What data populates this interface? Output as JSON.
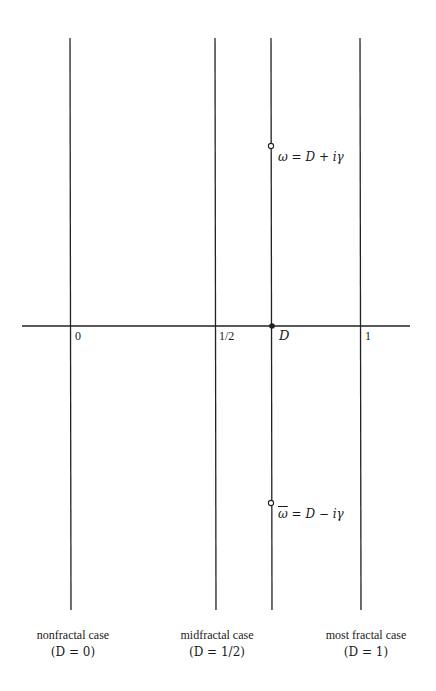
{
  "diagram": {
    "type": "complex-plane-fractal-dimension",
    "axis": {
      "ticks": [
        {
          "label": "0",
          "x": 71
        },
        {
          "label": "1/2",
          "x": 216
        },
        {
          "label": "D",
          "x": 272
        },
        {
          "label": "1",
          "x": 361
        }
      ]
    },
    "points": {
      "omega": {
        "label": "ω = D + iγ"
      },
      "omega_bar": {
        "label_bar": "ω",
        "label_rest": " = D − iγ"
      },
      "D": {
        "label": "D"
      }
    },
    "cases": [
      {
        "title": "nonfractal case",
        "condition": "(D = 0)"
      },
      {
        "title": "midfractal case",
        "condition": "(D = 1/2)"
      },
      {
        "title": "most fractal case",
        "condition": "(D = 1)"
      }
    ]
  }
}
